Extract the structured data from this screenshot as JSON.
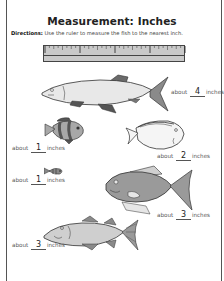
{
  "worksheet": {
    "title": "Measurement: Inches",
    "directions_label": "Directions:",
    "directions_text": " Use the ruler to measure the fish to the nearest inch."
  },
  "ruler": {
    "unit": "inches",
    "inches_shown": 4,
    "subdivisions_per_inch": 8
  },
  "answers": [
    {
      "fish": "long-silver-fish",
      "prefix": "about",
      "value": "4",
      "suffix": "inches"
    },
    {
      "fish": "striped-clownfish",
      "prefix": "about",
      "value": "1",
      "suffix": "inches"
    },
    {
      "fish": "white-angelfish",
      "prefix": "about",
      "value": "2",
      "suffix": "inches"
    },
    {
      "fish": "tiny-fish",
      "prefix": "about",
      "value": "1",
      "suffix": "inches"
    },
    {
      "fish": "gray-bass",
      "prefix": "about",
      "value": "3",
      "suffix": "inches"
    },
    {
      "fish": "spotted-cod",
      "prefix": "about",
      "value": "3",
      "suffix": "inches"
    }
  ],
  "colors": {
    "fish_light": "#e6e6e6",
    "fish_mid": "#a8a8a8",
    "fish_dark": "#6a6a6a",
    "outline": "#333333"
  }
}
